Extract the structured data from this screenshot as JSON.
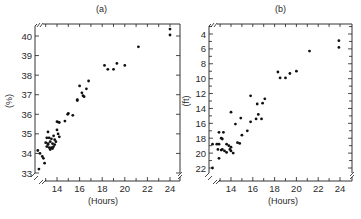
{
  "chart_data": [
    {
      "type": "scatter",
      "panel_label": "(a)",
      "title": "(a)",
      "xlabel": "(Hours)",
      "ylabel": "(%)",
      "xlim": [
        12.2,
        25.0
      ],
      "ylim": [
        32.6,
        40.6
      ],
      "y_inverted": false,
      "xticks": [
        14,
        16,
        18,
        20,
        22,
        24
      ],
      "yticks": [
        33,
        34,
        35,
        36,
        37,
        38,
        39,
        40
      ],
      "grid": false,
      "legend": null,
      "axis_breaks": true,
      "points": [
        [
          24.0,
          40.35
        ],
        [
          24.0,
          40.05
        ],
        [
          21.2,
          39.45
        ],
        [
          18.2,
          38.5
        ],
        [
          18.5,
          38.3
        ],
        [
          19.0,
          38.3
        ],
        [
          19.3,
          38.6
        ],
        [
          20.0,
          38.5
        ],
        [
          16.8,
          37.7
        ],
        [
          16.0,
          37.45
        ],
        [
          16.6,
          37.3
        ],
        [
          16.2,
          37.1
        ],
        [
          16.3,
          36.95
        ],
        [
          16.4,
          36.9
        ],
        [
          15.8,
          36.75
        ],
        [
          15.8,
          36.7
        ],
        [
          15.0,
          36.05
        ],
        [
          14.95,
          36.0
        ],
        [
          15.4,
          35.95
        ],
        [
          14.7,
          35.65
        ],
        [
          14.1,
          35.6
        ],
        [
          14.0,
          35.62
        ],
        [
          14.2,
          35.58
        ],
        [
          14.0,
          35.2
        ],
        [
          13.2,
          35.1
        ],
        [
          14.1,
          35.0
        ],
        [
          14.2,
          34.85
        ],
        [
          13.1,
          34.8
        ],
        [
          13.3,
          34.8
        ],
        [
          13.5,
          34.75
        ],
        [
          13.7,
          34.9
        ],
        [
          13.8,
          34.7
        ],
        [
          13.0,
          34.55
        ],
        [
          13.2,
          34.5
        ],
        [
          13.4,
          34.6
        ],
        [
          13.6,
          34.5
        ],
        [
          13.8,
          34.45
        ],
        [
          13.1,
          34.35
        ],
        [
          13.3,
          34.3
        ],
        [
          13.5,
          34.3
        ],
        [
          13.7,
          34.35
        ],
        [
          13.4,
          34.2
        ],
        [
          13.6,
          34.25
        ],
        [
          13.2,
          34.45
        ],
        [
          13.9,
          34.6
        ],
        [
          12.3,
          34.15
        ],
        [
          12.5,
          34.0
        ],
        [
          12.7,
          33.85
        ],
        [
          12.8,
          33.75
        ],
        [
          12.9,
          33.5
        ],
        [
          12.4,
          33.2
        ]
      ]
    },
    {
      "type": "scatter",
      "panel_label": "(b)",
      "title": "(b)",
      "xlabel": "(Hours)",
      "ylabel": "(ft)",
      "xlim": [
        12.0,
        25.0
      ],
      "ylim": [
        2.6,
        23.3
      ],
      "y_inverted": true,
      "xticks": [
        14,
        16,
        18,
        20,
        22,
        24
      ],
      "yticks": [
        4,
        6,
        8,
        10,
        12,
        14,
        16,
        18,
        20,
        22
      ],
      "grid": false,
      "legend": null,
      "axis_breaks": true,
      "points": [
        [
          23.9,
          4.9
        ],
        [
          23.9,
          5.8
        ],
        [
          21.2,
          6.3
        ],
        [
          18.3,
          9.1
        ],
        [
          18.5,
          9.9
        ],
        [
          19.0,
          9.9
        ],
        [
          19.4,
          9.3
        ],
        [
          20.0,
          9.0
        ],
        [
          15.8,
          12.3
        ],
        [
          17.1,
          12.7
        ],
        [
          16.9,
          13.3
        ],
        [
          16.4,
          13.4
        ],
        [
          14.0,
          14.5
        ],
        [
          16.5,
          14.8
        ],
        [
          16.3,
          15.4
        ],
        [
          16.8,
          15.4
        ],
        [
          14.9,
          15.3
        ],
        [
          15.8,
          15.8
        ],
        [
          14.4,
          16.1
        ],
        [
          15.5,
          17.0
        ],
        [
          15.0,
          17.6
        ],
        [
          14.8,
          18.7
        ],
        [
          14.6,
          18.6
        ],
        [
          12.9,
          17.2
        ],
        [
          13.3,
          17.2
        ],
        [
          13.1,
          18.0
        ],
        [
          13.2,
          18.1
        ],
        [
          12.3,
          18.8
        ],
        [
          12.7,
          18.8
        ],
        [
          12.9,
          18.8
        ],
        [
          13.6,
          18.8
        ],
        [
          13.8,
          19.0
        ],
        [
          14.0,
          19.2
        ],
        [
          13.1,
          19.6
        ],
        [
          13.2,
          19.5
        ],
        [
          13.4,
          19.7
        ],
        [
          13.6,
          19.9
        ],
        [
          12.8,
          19.5
        ],
        [
          13.9,
          19.5
        ],
        [
          14.0,
          19.7
        ],
        [
          14.2,
          20.0
        ],
        [
          12.9,
          20.7
        ],
        [
          12.3,
          22.0
        ]
      ]
    }
  ],
  "panels": [
    {
      "title": "(a)",
      "xlabel": "(Hours)",
      "ylabel": "(%)"
    },
    {
      "title": "(b)",
      "xlabel": "(Hours)",
      "ylabel": "(ft)"
    }
  ]
}
